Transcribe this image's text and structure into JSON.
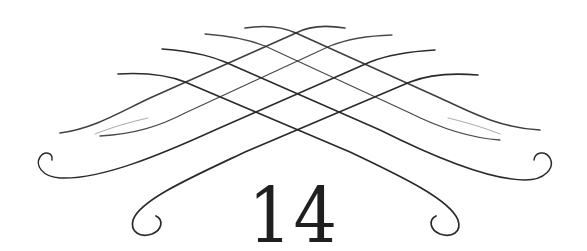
{
  "ornament": {
    "type": "calligraphic-flourish",
    "stroke_color": "#2a2a2a"
  },
  "number": "14"
}
